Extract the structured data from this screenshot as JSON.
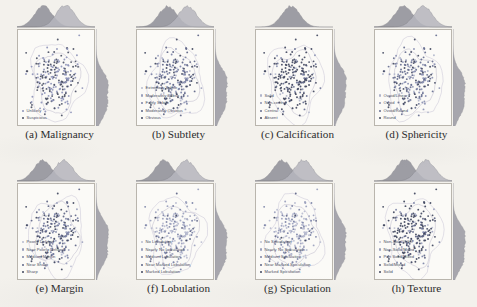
{
  "figure": {
    "type": "scatter-grid",
    "rows": 2,
    "cols": 4,
    "background_color": "#f3f1ec",
    "axes_background_color": "#fbfaf7",
    "legend_text_color": "#4a4f63"
  },
  "panels": [
    {
      "id": "malignancy",
      "caption": "(a) Malignancy",
      "legend": [
        {
          "label": "Unlikely",
          "color": "#8d93b8"
        },
        {
          "label": "Suspicious",
          "color": "#4a4f63"
        }
      ]
    },
    {
      "id": "subtlety",
      "caption": "(b) Subtlety",
      "legend": [
        {
          "label": "Extremely Subtle",
          "color": "#b9bcd0"
        },
        {
          "label": "Moderately Subtle",
          "color": "#9aa0bd"
        },
        {
          "label": "Fairly Subtle",
          "color": "#7b82a6"
        },
        {
          "label": "Moderately Obvious",
          "color": "#5d6486"
        },
        {
          "label": "Obvious",
          "color": "#40465e"
        }
      ]
    },
    {
      "id": "calcification",
      "caption": "(c) Calcification",
      "legend": [
        {
          "label": "Solid",
          "color": "#b0b5cb"
        },
        {
          "label": "Non-central",
          "color": "#8a90b2"
        },
        {
          "label": "Central",
          "color": "#656c8f"
        },
        {
          "label": "Absent",
          "color": "#42485f"
        }
      ]
    },
    {
      "id": "sphericity",
      "caption": "(d) Sphericity",
      "legend": [
        {
          "label": "Ovoid/Linear",
          "color": "#b0b5cb"
        },
        {
          "label": "Ovoid",
          "color": "#8a90b2"
        },
        {
          "label": "Ovoid/Round",
          "color": "#656c8f"
        },
        {
          "label": "Round",
          "color": "#42485f"
        }
      ]
    },
    {
      "id": "margin",
      "caption": "(e) Margin",
      "legend": [
        {
          "label": "Poorly Defined",
          "color": "#b9bcd0"
        },
        {
          "label": "Near Poorly Defined",
          "color": "#9aa0bd"
        },
        {
          "label": "Medium Margin",
          "color": "#7b82a6"
        },
        {
          "label": "Near Sharp",
          "color": "#5d6486"
        },
        {
          "label": "Sharp",
          "color": "#40465e"
        }
      ]
    },
    {
      "id": "lobulation",
      "caption": "(f) Lobulation",
      "legend": [
        {
          "label": "No Lobulation",
          "color": "#b9bcd0"
        },
        {
          "label": "Nearly No Lobulation",
          "color": "#9aa0bd"
        },
        {
          "label": "Medium Lobulation",
          "color": "#7b82a6"
        },
        {
          "label": "Near Marked Lobulation",
          "color": "#5d6486"
        },
        {
          "label": "Marked Lobulation",
          "color": "#40465e"
        }
      ]
    },
    {
      "id": "spiculation",
      "caption": "(g) Spiculation",
      "legend": [
        {
          "label": "No Spiculation",
          "color": "#b9bcd0"
        },
        {
          "label": "Nearly No Spiculation",
          "color": "#9aa0bd"
        },
        {
          "label": "Medium Spiculation",
          "color": "#7b82a6"
        },
        {
          "label": "Near Marked Spiculation",
          "color": "#5d6486"
        },
        {
          "label": "Marked Spiculation",
          "color": "#40465e"
        }
      ]
    },
    {
      "id": "texture",
      "caption": "(h) Texture",
      "legend": [
        {
          "label": "Non-Solid/GGO",
          "color": "#b9bcd0"
        },
        {
          "label": "Non-Solid/Mixed",
          "color": "#9aa0bd"
        },
        {
          "label": "Part Solid/Mixed",
          "color": "#7b82a6"
        },
        {
          "label": "Solid/Mixed",
          "color": "#5d6486"
        },
        {
          "label": "Solid",
          "color": "#40465e"
        }
      ]
    }
  ],
  "chart_data": {
    "type": "scatter",
    "title": "",
    "xlabel": "",
    "ylabel": "",
    "xlim": [
      0,
      1
    ],
    "ylim": [
      0,
      1
    ],
    "grid": false,
    "legend_position": "lower-left",
    "marginal_plots": [
      "top-density",
      "right-density"
    ],
    "contour_levels": 2,
    "note": "Each panel plots the same 2-D embedding of nodule samples, recoloured by one attribute; marginal kernel-density curves are drawn on the top and right margins.",
    "points_per_panel": 230,
    "panels": [
      {
        "id": "malignancy",
        "classes": [
          "Unlikely",
          "Suspicious"
        ],
        "class_counts": [
          118,
          112
        ],
        "colors": [
          "#8d93b8",
          "#4a4f63"
        ],
        "top_density_modes": [
          0.34,
          0.62
        ],
        "right_density_modes": [
          0.55
        ]
      },
      {
        "id": "subtlety",
        "classes": [
          "Extremely Subtle",
          "Moderately Subtle",
          "Fairly Subtle",
          "Moderately Obvious",
          "Obvious"
        ],
        "class_counts": [
          18,
          34,
          52,
          70,
          56
        ],
        "colors": [
          "#b9bcd0",
          "#9aa0bd",
          "#7b82a6",
          "#5d6486",
          "#40465e"
        ],
        "top_density_modes": [
          0.41,
          0.66
        ],
        "right_density_modes": [
          0.52
        ]
      },
      {
        "id": "calcification",
        "classes": [
          "Solid",
          "Non-central",
          "Central",
          "Absent"
        ],
        "class_counts": [
          12,
          20,
          28,
          170
        ],
        "colors": [
          "#b0b5cb",
          "#8a90b2",
          "#656c8f",
          "#42485f"
        ],
        "top_density_modes": [
          0.46
        ],
        "right_density_modes": [
          0.5
        ]
      },
      {
        "id": "sphericity",
        "classes": [
          "Ovoid/Linear",
          "Ovoid",
          "Ovoid/Round",
          "Round"
        ],
        "class_counts": [
          22,
          64,
          86,
          58
        ],
        "colors": [
          "#b0b5cb",
          "#8a90b2",
          "#656c8f",
          "#42485f"
        ],
        "top_density_modes": [
          0.38,
          0.63
        ],
        "right_density_modes": [
          0.54
        ]
      },
      {
        "id": "margin",
        "classes": [
          "Poorly Defined",
          "Near Poorly Defined",
          "Medium Margin",
          "Near Sharp",
          "Sharp"
        ],
        "class_counts": [
          16,
          30,
          48,
          68,
          68
        ],
        "colors": [
          "#b9bcd0",
          "#9aa0bd",
          "#7b82a6",
          "#5d6486",
          "#40465e"
        ],
        "top_density_modes": [
          0.33,
          0.6
        ],
        "right_density_modes": [
          0.48
        ]
      },
      {
        "id": "lobulation",
        "classes": [
          "No Lobulation",
          "Nearly No Lobulation",
          "Medium Lobulation",
          "Near Marked Lobulation",
          "Marked Lobulation"
        ],
        "class_counts": [
          92,
          64,
          42,
          20,
          12
        ],
        "colors": [
          "#b9bcd0",
          "#9aa0bd",
          "#7b82a6",
          "#5d6486",
          "#40465e"
        ],
        "top_density_modes": [
          0.36,
          0.64
        ],
        "right_density_modes": [
          0.52
        ]
      },
      {
        "id": "spiculation",
        "classes": [
          "No Spiculation",
          "Nearly No Spiculation",
          "Medium Spiculation",
          "Near Marked Spiculation",
          "Marked Spiculation"
        ],
        "class_counts": [
          104,
          58,
          38,
          18,
          12
        ],
        "colors": [
          "#b9bcd0",
          "#9aa0bd",
          "#7b82a6",
          "#5d6486",
          "#40465e"
        ],
        "top_density_modes": [
          0.35,
          0.62
        ],
        "right_density_modes": [
          0.5
        ]
      },
      {
        "id": "texture",
        "classes": [
          "Non-Solid/GGO",
          "Non-Solid/Mixed",
          "Part Solid/Mixed",
          "Solid/Mixed",
          "Solid"
        ],
        "class_counts": [
          10,
          14,
          22,
          40,
          144
        ],
        "colors": [
          "#b9bcd0",
          "#9aa0bd",
          "#7b82a6",
          "#5d6486",
          "#40465e"
        ],
        "top_density_modes": [
          0.4,
          0.67
        ],
        "right_density_modes": [
          0.53
        ]
      }
    ]
  }
}
